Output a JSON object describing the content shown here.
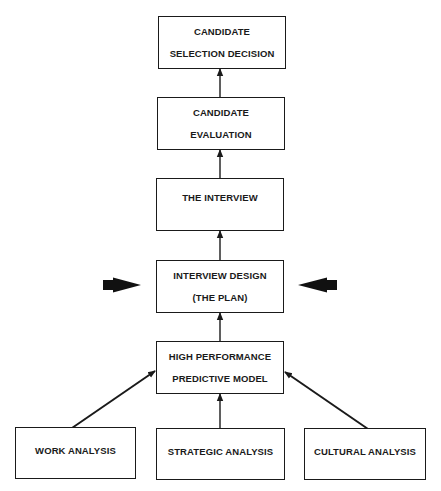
{
  "diagram": {
    "type": "flowchart",
    "direction": "bottom-to-top",
    "nodes": [
      {
        "id": "selection",
        "lines": [
          "CANDIDATE",
          "SELECTION DECISION"
        ]
      },
      {
        "id": "evaluation",
        "lines": [
          "CANDIDATE",
          "EVALUATION"
        ]
      },
      {
        "id": "interview",
        "lines": [
          "THE INTERVIEW"
        ]
      },
      {
        "id": "design",
        "lines": [
          "INTERVIEW DESIGN",
          "(THE PLAN)"
        ]
      },
      {
        "id": "model",
        "lines": [
          "HIGH PERFORMANCE",
          "PREDICTIVE MODEL"
        ]
      },
      {
        "id": "work",
        "lines": [
          "WORK ANALYSIS"
        ]
      },
      {
        "id": "strategic",
        "lines": [
          "STRATEGIC ANALYSIS"
        ]
      },
      {
        "id": "cultural",
        "lines": [
          "CULTURAL ANALYSIS"
        ]
      }
    ],
    "edges": [
      {
        "from": "work",
        "to": "model"
      },
      {
        "from": "strategic",
        "to": "model"
      },
      {
        "from": "cultural",
        "to": "model"
      },
      {
        "from": "model",
        "to": "design"
      },
      {
        "from": "design",
        "to": "interview"
      },
      {
        "from": "interview",
        "to": "evaluation"
      },
      {
        "from": "evaluation",
        "to": "selection"
      }
    ],
    "emphasis_arrows": [
      {
        "side": "left",
        "points_to": "design"
      },
      {
        "side": "right",
        "points_to": "design"
      }
    ],
    "colors": {
      "stroke": "#1a1a1a",
      "background": "#ffffff"
    }
  }
}
